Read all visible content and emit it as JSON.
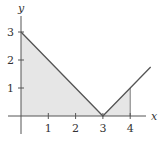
{
  "chart_data": {
    "type": "line",
    "title": "",
    "function": "y = |x - 3|",
    "xlabel": "x",
    "ylabel": "y",
    "xlim": [
      -0.6,
      4.9
    ],
    "ylim": [
      -0.6,
      3.6
    ],
    "x_ticks": [
      1,
      2,
      3,
      4
    ],
    "y_ticks": [
      1,
      2,
      3
    ],
    "series": [
      {
        "name": "y = |x - 3|",
        "x": [
          0,
          3,
          4.75
        ],
        "y": [
          3,
          0,
          1.75
        ]
      }
    ],
    "shaded_region": {
      "description": "area under y = |x - 3| from x = 0 to x = 4",
      "x_from": 0,
      "x_to": 4,
      "polygon": [
        [
          0,
          0
        ],
        [
          0,
          3
        ],
        [
          3,
          0
        ],
        [
          4,
          1
        ],
        [
          4,
          0
        ]
      ]
    },
    "grid": false,
    "legend": null
  },
  "colors": {
    "axis": "#555555",
    "curve": "#555555",
    "fill": "#e6e6e6",
    "text": "#333333"
  },
  "labels": {
    "x_axis": "x",
    "y_axis": "y",
    "x_ticks": [
      "1",
      "2",
      "3",
      "4"
    ],
    "y_ticks": [
      "1",
      "2",
      "3"
    ]
  }
}
